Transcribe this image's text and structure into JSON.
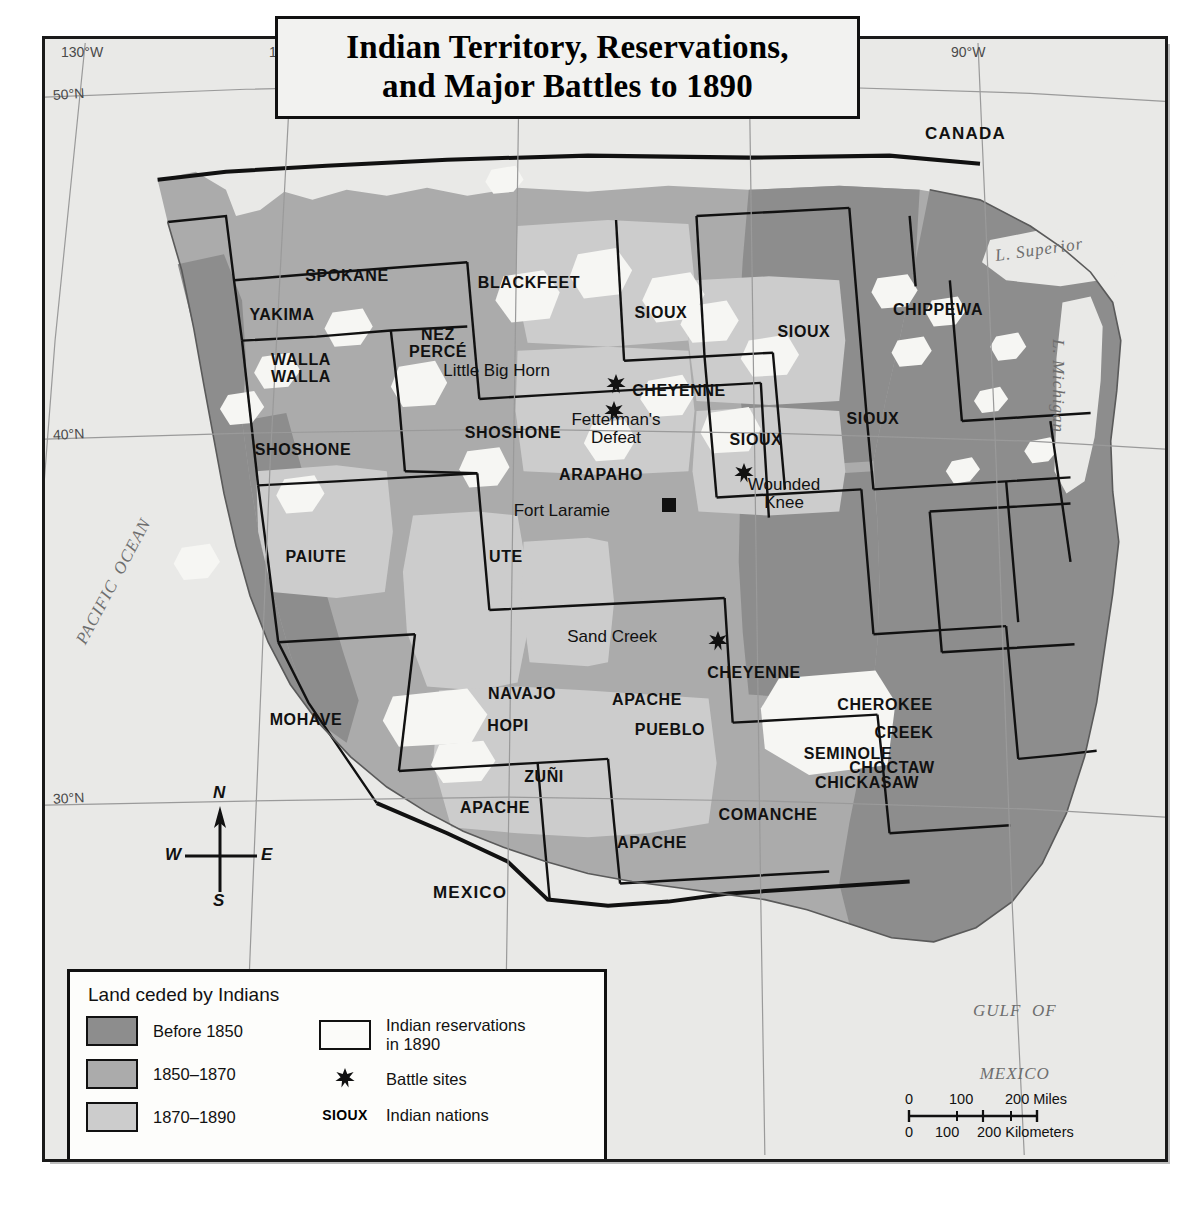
{
  "title": {
    "line1": "Indian Territory, Reservations,",
    "line2": "and Major Battles to 1890"
  },
  "graticule": {
    "longitudes": [
      "130°W",
      "120°W",
      "110°W",
      "100°W",
      "90°W"
    ],
    "latitudes": [
      "50°N",
      "40°N",
      "30°N"
    ]
  },
  "countries": [
    {
      "name": "CANADA",
      "x": 965,
      "y": 131
    },
    {
      "name": "MEXICO",
      "x": 430,
      "y": 885
    }
  ],
  "water_bodies": [
    {
      "name": "PACIFIC OCEAN",
      "x": 60,
      "y": 610,
      "rotate": -62,
      "size": 19
    },
    {
      "name": "GULF OF MEXICO",
      "x": 958,
      "y": 935,
      "rotate": 0,
      "size": 18,
      "lines": [
        "GULF  OF",
        "MEXICO"
      ]
    },
    {
      "name": "L. Superior",
      "x": 995,
      "y": 248,
      "rotate": -8,
      "size": 17
    },
    {
      "name": "L. Michigan",
      "x": 1068,
      "y": 370,
      "rotate": 90,
      "size": 17
    }
  ],
  "nations": [
    {
      "label": "SPOKANE",
      "x": 302,
      "y": 238
    },
    {
      "label": "YAKIMA",
      "x": 237,
      "y": 277
    },
    {
      "label": "WALLA\nWALLA",
      "x": 256,
      "y": 322
    },
    {
      "label": "NEZ\nPERCÉ",
      "x": 393,
      "y": 297
    },
    {
      "label": "BLACKFEET",
      "x": 484,
      "y": 245
    },
    {
      "label": "SIOUX",
      "x": 616,
      "y": 275
    },
    {
      "label": "SIOUX",
      "x": 759,
      "y": 294
    },
    {
      "label": "CHIPPEWA",
      "x": 893,
      "y": 272
    },
    {
      "label": "SHOSHONE",
      "x": 258,
      "y": 412
    },
    {
      "label": "SHOSHONE",
      "x": 468,
      "y": 395
    },
    {
      "label": "CHEYENNE",
      "x": 634,
      "y": 353
    },
    {
      "label": "SIOUX",
      "x": 828,
      "y": 381
    },
    {
      "label": "SIOUX",
      "x": 711,
      "y": 402
    },
    {
      "label": "ARAPAHO",
      "x": 556,
      "y": 437
    },
    {
      "label": "PAIUTE",
      "x": 271,
      "y": 519
    },
    {
      "label": "UTE",
      "x": 461,
      "y": 519
    },
    {
      "label": "MOHAVE",
      "x": 261,
      "y": 682
    },
    {
      "label": "NAVAJO",
      "x": 477,
      "y": 656
    },
    {
      "label": "HOPI",
      "x": 463,
      "y": 688
    },
    {
      "label": "ZUÑI",
      "x": 499,
      "y": 739
    },
    {
      "label": "APACHE",
      "x": 450,
      "y": 770
    },
    {
      "label": "APACHE",
      "x": 602,
      "y": 662
    },
    {
      "label": "PUEBLO",
      "x": 625,
      "y": 692
    },
    {
      "label": "APACHE",
      "x": 607,
      "y": 805
    },
    {
      "label": "CHEYENNE",
      "x": 709,
      "y": 635
    },
    {
      "label": "COMANCHE",
      "x": 723,
      "y": 777
    },
    {
      "label": "CHEROKEE",
      "x": 840,
      "y": 667
    },
    {
      "label": "CREEK",
      "x": 859,
      "y": 695
    },
    {
      "label": "SEMINOLE",
      "x": 803,
      "y": 716
    },
    {
      "label": "CHOCTAW",
      "x": 847,
      "y": 730
    },
    {
      "label": "CHICKASAW",
      "x": 822,
      "y": 745
    }
  ],
  "battles": [
    {
      "name": "Little Big Horn",
      "label_x": 505,
      "label_y": 334,
      "star_x": 571,
      "star_y": 345,
      "align": "right"
    },
    {
      "name": "Fetterman's\nDefeat",
      "label_x": 571,
      "label_y": 383,
      "star_x": 569,
      "star_y": 372,
      "align": "center"
    },
    {
      "name": "Wounded\nKnee",
      "label_x": 739,
      "label_y": 448,
      "star_x": 699,
      "star_y": 434,
      "align": "center"
    },
    {
      "name": "Sand Creek",
      "label_x": 612,
      "label_y": 600,
      "star_x": 673,
      "star_y": 602,
      "align": "right"
    }
  ],
  "forts": [
    {
      "name": "Fort Laramie",
      "label_x": 565,
      "label_y": 474,
      "marker_x": 624,
      "marker_y": 466
    }
  ],
  "legend": {
    "title": "Land ceded by Indians",
    "ceded": [
      {
        "label": "Before 1850",
        "color": "#8d8d8d"
      },
      {
        "label": "1850–1870",
        "color": "#ababab"
      },
      {
        "label": "1870–1890",
        "color": "#cccccc"
      }
    ],
    "reservations": {
      "label": "Indian reservations\nin 1890",
      "color": "#fbfbf9"
    },
    "battle_sites": {
      "label": "Battle sites",
      "icon": "battle-star-icon"
    },
    "nations_key": {
      "key": "SIOUX",
      "label": "Indian nations"
    }
  },
  "scale": {
    "miles": {
      "ticks": [
        "0",
        "100",
        "200 Miles"
      ]
    },
    "kilometers": {
      "ticks": [
        "0",
        "100",
        "200 Kilometers"
      ]
    }
  },
  "compass": {
    "n": "N",
    "e": "E",
    "s": "S",
    "w": "W"
  },
  "colors": {
    "before_1850": "#8d8d8d",
    "ceded_1850_1870": "#ababab",
    "ceded_1870_1890": "#cccccc",
    "reservation": "#f4f4f1",
    "ocean": "#e9e9e7",
    "border": "#111111"
  }
}
